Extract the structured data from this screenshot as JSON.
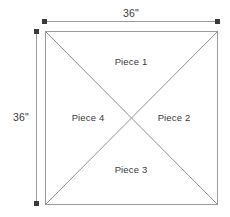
{
  "figure": {
    "background_color": "#ffffff",
    "line_color": "#9a9a9a",
    "diagonal_color": "#8f8f8f",
    "endpoint_color": "#3a3a3a",
    "text_color": "#3a3a3a",
    "shape": {
      "name": "square",
      "side_length": "36\"",
      "top_left": [
        45,
        31
      ],
      "bottom_right": [
        218,
        205
      ],
      "center": [
        131,
        118
      ]
    },
    "pieces": [
      {
        "id": "piece-1",
        "label": "Piece 1",
        "position": "top"
      },
      {
        "id": "piece-2",
        "label": "Piece 2",
        "position": "right"
      },
      {
        "id": "piece-3",
        "label": "Piece 3",
        "position": "bottom"
      },
      {
        "id": "piece-4",
        "label": "Piece 4",
        "position": "left"
      }
    ],
    "dimensions": [
      {
        "id": "dimension-top",
        "label": "36\"",
        "orientation": "horizontal",
        "measures": "width",
        "line": {
          "x1": 44,
          "y1": 21,
          "x2": 218,
          "y2": 21
        },
        "endpoint_style": "square-dot"
      },
      {
        "id": "dimension-left",
        "label": "36\"",
        "orientation": "vertical",
        "measures": "height",
        "line": {
          "x1": 36,
          "y1": 31,
          "x2": 36,
          "y2": 204
        },
        "endpoint_style": "square-dot"
      }
    ],
    "diagonals": [
      {
        "id": "diagonal-tl-br",
        "from": [
          45,
          31
        ],
        "to": [
          218,
          205
        ]
      },
      {
        "id": "diagonal-tr-bl",
        "from": [
          218,
          31
        ],
        "to": [
          45,
          205
        ]
      }
    ]
  }
}
